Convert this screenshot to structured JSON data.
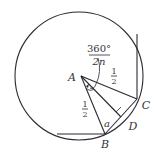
{
  "diagram": {
    "points": {
      "A": {
        "label": "A",
        "x": 81,
        "y": 76
      },
      "B": {
        "label": "B",
        "x": 105,
        "y": 134
      },
      "C": {
        "label": "C",
        "x": 137,
        "y": 99
      },
      "D": {
        "label": "D",
        "x": 121,
        "y": 117
      }
    },
    "labels": {
      "angle_numerator": "360°",
      "angle_denominator": "2n",
      "half_top_num": "1",
      "half_top_den": "2",
      "half_left_num": "1",
      "half_left_den": "2",
      "apothem": "a",
      "A": "A",
      "B": "B",
      "C": "C",
      "D": "D"
    },
    "colors": {
      "stroke": "#2b2b33",
      "text": "#33333a",
      "background": "#ffffff"
    }
  }
}
